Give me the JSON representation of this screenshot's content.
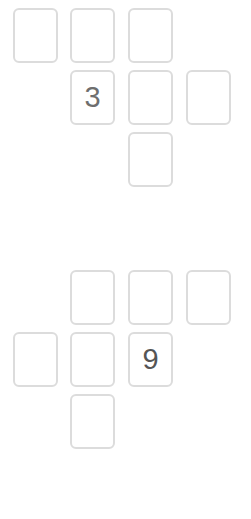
{
  "puzzle": {
    "background_color": "#ffffff",
    "cell_border_color": "#dcdcdc",
    "cell_fill_color": "#ffffff",
    "groups": [
      {
        "name": "upper-word-cluster",
        "top": 8,
        "rows": [
          {
            "name": "upper-row-1",
            "cells": [
              {
                "column": 1,
                "value": "",
                "filled": false
              },
              {
                "column": 2,
                "value": "",
                "filled": false
              },
              {
                "column": 3,
                "value": "",
                "filled": false
              }
            ]
          },
          {
            "name": "upper-row-2",
            "cells": [
              {
                "column": 2,
                "value": "3",
                "filled": true,
                "text_color": "#6e6e6e"
              },
              {
                "column": 3,
                "value": "",
                "filled": false
              },
              {
                "column": 4,
                "value": "",
                "filled": false
              }
            ]
          },
          {
            "name": "upper-row-3",
            "cells": [
              {
                "column": 3,
                "value": "",
                "filled": false
              }
            ]
          }
        ]
      },
      {
        "name": "lower-word-cluster",
        "top": 270,
        "rows": [
          {
            "name": "lower-row-1",
            "cells": [
              {
                "column": 2,
                "value": "",
                "filled": false
              },
              {
                "column": 3,
                "value": "",
                "filled": false
              },
              {
                "column": 4,
                "value": "",
                "filled": false
              }
            ]
          },
          {
            "name": "lower-row-2",
            "cells": [
              {
                "column": 1,
                "value": "",
                "filled": false
              },
              {
                "column": 2,
                "value": "",
                "filled": false
              },
              {
                "column": 3,
                "value": "9",
                "filled": true,
                "text_color": "#555555"
              }
            ]
          },
          {
            "name": "lower-row-3",
            "cells": [
              {
                "column": 2,
                "value": "",
                "filled": false
              }
            ]
          }
        ]
      }
    ]
  }
}
